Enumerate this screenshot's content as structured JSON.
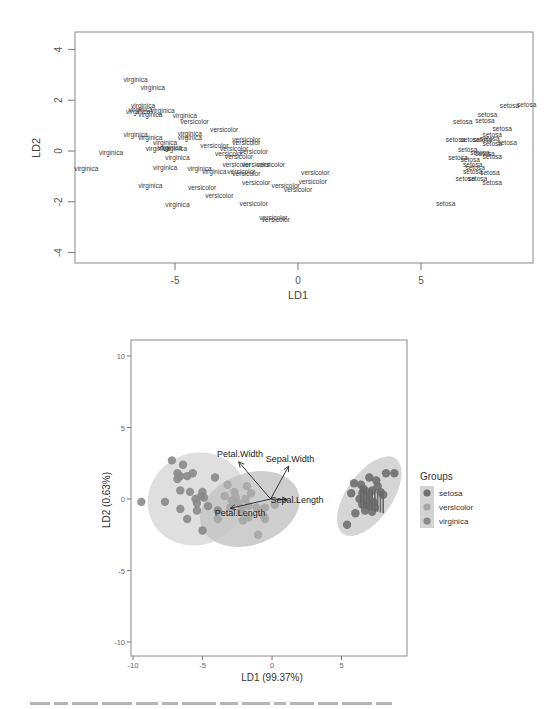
{
  "chart_data": [
    {
      "type": "scatter",
      "title": "",
      "xlabel": "LD1",
      "ylabel": "LD2",
      "xlim": [
        -9.3,
        9.3
      ],
      "ylim": [
        -4.5,
        4.6
      ],
      "xticks": [
        "-5",
        "0",
        "5"
      ],
      "xtick_values": [
        -5,
        0,
        5
      ],
      "yticks": [
        "-4",
        "-2",
        "0",
        "2",
        "4"
      ],
      "ytick_values": [
        -4,
        -2,
        0,
        2,
        4
      ],
      "grid": false,
      "legend": "none",
      "marker": "text-label",
      "points": [
        {
          "label": "virginica",
          "x": -6.6,
          "y": 2.8
        },
        {
          "label": "virginica",
          "x": -5.9,
          "y": 2.5
        },
        {
          "label": "virginica",
          "x": -6.3,
          "y": 1.8
        },
        {
          "label": "virginica",
          "x": -6.4,
          "y": 1.65
        },
        {
          "label": "virginica",
          "x": -6.5,
          "y": 1.55
        },
        {
          "label": "virginica",
          "x": -5.5,
          "y": 1.6
        },
        {
          "label": "virginica",
          "x": -6.0,
          "y": 1.45
        },
        {
          "label": "virginica",
          "x": -4.6,
          "y": 1.4
        },
        {
          "label": "versicolor",
          "x": -4.2,
          "y": 1.15
        },
        {
          "label": "versicolor",
          "x": -3.0,
          "y": 0.85
        },
        {
          "label": "virginica",
          "x": -6.6,
          "y": 0.65
        },
        {
          "label": "virginica",
          "x": -6.0,
          "y": 0.55
        },
        {
          "label": "virginica",
          "x": -4.4,
          "y": 0.7
        },
        {
          "label": "virginica",
          "x": -4.4,
          "y": 0.55
        },
        {
          "label": "virginica",
          "x": -5.4,
          "y": 0.35
        },
        {
          "label": "versicolor",
          "x": -2.1,
          "y": 0.45
        },
        {
          "label": "versicolor",
          "x": -2.1,
          "y": 0.35
        },
        {
          "label": "virginica",
          "x": -7.6,
          "y": -0.05
        },
        {
          "label": "virginica",
          "x": -5.7,
          "y": 0.1
        },
        {
          "label": "virginica",
          "x": -5.2,
          "y": 0.15
        },
        {
          "label": "virginica",
          "x": -5.0,
          "y": 0.1
        },
        {
          "label": "versicolor",
          "x": -3.4,
          "y": 0.2
        },
        {
          "label": "versicolor",
          "x": -2.6,
          "y": 0.1
        },
        {
          "label": "versicolor",
          "x": -1.8,
          "y": 0.0
        },
        {
          "label": "versicolor",
          "x": -2.8,
          "y": -0.1
        },
        {
          "label": "versicolor",
          "x": -2.4,
          "y": -0.2
        },
        {
          "label": "virginica",
          "x": -4.9,
          "y": -0.25
        },
        {
          "label": "versicolor",
          "x": -2.5,
          "y": -0.55
        },
        {
          "label": "versicolor",
          "x": -1.7,
          "y": -0.55
        },
        {
          "label": "versicolor",
          "x": -1.1,
          "y": -0.55
        },
        {
          "label": "virginica",
          "x": -8.6,
          "y": -0.7
        },
        {
          "label": "virginica",
          "x": -5.4,
          "y": -0.65
        },
        {
          "label": "virginica",
          "x": -4.0,
          "y": -0.7
        },
        {
          "label": "virginica",
          "x": -3.4,
          "y": -0.8
        },
        {
          "label": "versicolor",
          "x": -2.3,
          "y": -0.8
        },
        {
          "label": "versicolor",
          "x": -2.1,
          "y": -0.9
        },
        {
          "label": "versicolor",
          "x": 0.7,
          "y": -0.85
        },
        {
          "label": "virginica",
          "x": -6.0,
          "y": -1.35
        },
        {
          "label": "versicolor",
          "x": -3.9,
          "y": -1.45
        },
        {
          "label": "versicolor",
          "x": -1.7,
          "y": -1.25
        },
        {
          "label": "versicolor",
          "x": -0.5,
          "y": -1.35
        },
        {
          "label": "versicolor",
          "x": 0.6,
          "y": -1.2
        },
        {
          "label": "versicolor",
          "x": 0.0,
          "y": -1.5
        },
        {
          "label": "versicolor",
          "x": -3.2,
          "y": -1.75
        },
        {
          "label": "versicolor",
          "x": -1.8,
          "y": -2.05
        },
        {
          "label": "virginica",
          "x": -4.9,
          "y": -2.1
        },
        {
          "label": "versicolor",
          "x": -1.0,
          "y": -2.6
        },
        {
          "label": "versicolor",
          "x": -0.9,
          "y": -2.7
        },
        {
          "label": "setosa",
          "x": 8.6,
          "y": 1.8
        },
        {
          "label": "setosa",
          "x": 9.3,
          "y": 1.85
        },
        {
          "label": "setosa",
          "x": 7.7,
          "y": 1.45
        },
        {
          "label": "setosa",
          "x": 6.7,
          "y": 1.15
        },
        {
          "label": "setosa",
          "x": 7.6,
          "y": 1.2
        },
        {
          "label": "setosa",
          "x": 8.3,
          "y": 0.9
        },
        {
          "label": "setosa",
          "x": 7.9,
          "y": 0.65
        },
        {
          "label": "setosa",
          "x": 6.4,
          "y": 0.45
        },
        {
          "label": "setosa",
          "x": 7.0,
          "y": 0.45
        },
        {
          "label": "setosa",
          "x": 7.5,
          "y": 0.45
        },
        {
          "label": "setosa",
          "x": 7.8,
          "y": 0.5
        },
        {
          "label": "setosa",
          "x": 8.5,
          "y": 0.35
        },
        {
          "label": "setosa",
          "x": 7.9,
          "y": 0.3
        },
        {
          "label": "setosa",
          "x": 6.9,
          "y": 0.05
        },
        {
          "label": "setosa",
          "x": 7.4,
          "y": -0.05
        },
        {
          "label": "setosa",
          "x": 7.6,
          "y": -0.1
        },
        {
          "label": "setosa",
          "x": 7.9,
          "y": -0.2
        },
        {
          "label": "setosa",
          "x": 6.5,
          "y": -0.25
        },
        {
          "label": "setosa",
          "x": 7.0,
          "y": -0.35
        },
        {
          "label": "setosa",
          "x": 7.1,
          "y": -0.55
        },
        {
          "label": "setosa",
          "x": 7.2,
          "y": -0.65
        },
        {
          "label": "setosa",
          "x": 7.1,
          "y": -0.8
        },
        {
          "label": "setosa",
          "x": 7.8,
          "y": -0.85
        },
        {
          "label": "setosa",
          "x": 6.8,
          "y": -1.1
        },
        {
          "label": "setosa",
          "x": 7.3,
          "y": -1.1
        },
        {
          "label": "setosa",
          "x": 7.9,
          "y": -1.25
        },
        {
          "label": "setosa",
          "x": 6.0,
          "y": -2.05
        }
      ]
    },
    {
      "type": "scatter",
      "title": "",
      "xlabel": "LD1 (99.37%)",
      "ylabel": "LD2 (0.63%)",
      "xlim": [
        -10.2,
        9.6
      ],
      "ylim": [
        -11.0,
        11.1
      ],
      "xticks": [
        "-10",
        "-5",
        "0",
        "5"
      ],
      "xtick_values": [
        -10,
        -5,
        0,
        5
      ],
      "yticks": [
        "-10",
        "-5",
        "0",
        "5",
        "10"
      ],
      "ytick_values": [
        -10,
        -5,
        0,
        5,
        10
      ],
      "grid": false,
      "legend_position": "right",
      "legend": {
        "title": "Groups",
        "entries": [
          {
            "label": "setosa",
            "color": "#6f6f6f"
          },
          {
            "label": "versicolor",
            "color": "#a6a6a6"
          },
          {
            "label": "virginica",
            "color": "#8a8a8a"
          }
        ]
      },
      "ellipses": [
        {
          "group": "virginica",
          "cx": -5.4,
          "cy": 0.0,
          "rx": 3.6,
          "ry": 3.2,
          "angle": -25,
          "color": "#d9d9d9"
        },
        {
          "group": "versicolor",
          "cx": -1.6,
          "cy": -0.7,
          "rx": 3.7,
          "ry": 2.5,
          "angle": -20,
          "color": "#c6c6c6"
        },
        {
          "group": "setosa",
          "cx": 7.0,
          "cy": 0.2,
          "rx": 3.3,
          "ry": 1.6,
          "angle": -55,
          "color": "#cfcfcf"
        }
      ],
      "biplot_arrows": [
        {
          "label": "Petal.Width",
          "x_end": -2.4,
          "y_end": 2.6,
          "label_x": -2.3,
          "label_y": 3.15
        },
        {
          "label": "Sepal.Width",
          "x_end": 1.2,
          "y_end": 2.3,
          "label_x": 1.3,
          "label_y": 2.8
        },
        {
          "label": "Sepal.Length",
          "x_end": 1.1,
          "y_end": -0.05,
          "label_x": 1.8,
          "label_y": -0.05
        },
        {
          "label": "Petal.Length",
          "x_end": -3.0,
          "y_end": -0.65,
          "label_x": -2.3,
          "label_y": -0.95
        }
      ],
      "arrow_origin": [
        -0.1,
        0.0
      ],
      "points": {
        "virginica": [
          [
            -9.4,
            -0.2
          ],
          [
            -7.2,
            2.7
          ],
          [
            -6.4,
            2.4
          ],
          [
            -6.8,
            1.8
          ],
          [
            -6.6,
            1.6
          ],
          [
            -6.8,
            1.4
          ],
          [
            -6.1,
            1.6
          ],
          [
            -5.7,
            1.8
          ],
          [
            -4.1,
            1.5
          ],
          [
            -6.6,
            0.6
          ],
          [
            -5.9,
            0.5
          ],
          [
            -5.0,
            0.5
          ],
          [
            -7.7,
            -0.2
          ],
          [
            -5.5,
            0.0
          ],
          [
            -5.1,
            0.2
          ],
          [
            -4.9,
            0.1
          ],
          [
            -5.4,
            -0.3
          ],
          [
            -4.6,
            -0.5
          ],
          [
            -6.6,
            -0.7
          ],
          [
            -5.4,
            -0.8
          ],
          [
            -3.9,
            -0.8
          ],
          [
            -6.1,
            -1.4
          ],
          [
            -5.0,
            -2.2
          ]
        ],
        "versicolor": [
          [
            -3.2,
            1.0
          ],
          [
            -1.8,
            0.9
          ],
          [
            -2.7,
            0.5
          ],
          [
            -1.5,
            0.4
          ],
          [
            -3.4,
            0.2
          ],
          [
            -2.6,
            0.1
          ],
          [
            -1.9,
            0.0
          ],
          [
            -2.9,
            -0.1
          ],
          [
            -2.4,
            -0.3
          ],
          [
            -1.7,
            -0.5
          ],
          [
            -3.0,
            -0.6
          ],
          [
            -2.2,
            -0.7
          ],
          [
            -1.1,
            -0.6
          ],
          [
            -0.5,
            -0.6
          ],
          [
            0.2,
            -0.4
          ],
          [
            -2.3,
            -0.9
          ],
          [
            -3.9,
            -1.4
          ],
          [
            -1.7,
            -1.3
          ],
          [
            -0.5,
            -1.4
          ],
          [
            -2.1,
            -1.5
          ],
          [
            -0.6,
            -1.2
          ],
          [
            -1.0,
            -2.5
          ]
        ],
        "setosa": [
          [
            8.2,
            1.8
          ],
          [
            8.8,
            1.8
          ],
          [
            7.0,
            1.5
          ],
          [
            7.5,
            1.3
          ],
          [
            5.9,
            1.1
          ],
          [
            6.4,
            1.0
          ],
          [
            7.6,
            0.9
          ],
          [
            6.6,
            0.7
          ],
          [
            7.2,
            0.6
          ],
          [
            7.8,
            0.5
          ],
          [
            5.7,
            0.4
          ],
          [
            6.5,
            0.4
          ],
          [
            7.0,
            0.3
          ],
          [
            8.0,
            0.3
          ],
          [
            6.3,
            0.0
          ],
          [
            6.8,
            -0.1
          ],
          [
            7.3,
            -0.2
          ],
          [
            6.5,
            -0.4
          ],
          [
            7.0,
            -0.5
          ],
          [
            7.4,
            -0.6
          ],
          [
            6.7,
            -0.8
          ],
          [
            7.2,
            -0.9
          ],
          [
            6.0,
            -1.0
          ],
          [
            5.4,
            -1.8
          ]
        ]
      }
    }
  ]
}
